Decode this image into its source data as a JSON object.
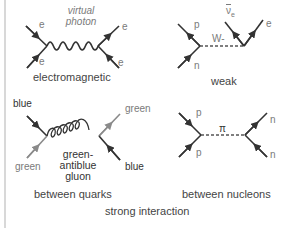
{
  "colors": {
    "line_dark": "#333333",
    "line_grey": "#8a8a8a",
    "label_grey": "#7a7a7a",
    "caption": "#444444",
    "left_rule": "#d8d8d8"
  },
  "diagrams": {
    "electromagnetic": {
      "caption": "electromagnetic",
      "mediator": "virtual photon",
      "mediator_line1": "virtual",
      "mediator_line2": "photon",
      "particles": {
        "top_left": "e",
        "bottom_left": "e",
        "top_right": "e",
        "bottom_right": "e"
      }
    },
    "weak": {
      "caption": "weak",
      "mediator": "W-",
      "particles": {
        "top_left": "p",
        "bottom_left": "n",
        "top_right_a": "ν̄e",
        "top_right_a_main": "ν",
        "top_right_a_sub": "e",
        "top_right_b": "e"
      }
    },
    "quarks": {
      "caption": "between quarks",
      "mediator_line1": "green-",
      "mediator_line2": "antiblue",
      "mediator_line3": "gluon",
      "particles": {
        "top_left": "blue",
        "bottom_left": "green",
        "top_right": "green",
        "bottom_right": "blue"
      }
    },
    "nucleons": {
      "caption": "between nucleons",
      "mediator": "π",
      "particles": {
        "top_left": "p",
        "bottom_left": "p",
        "top_right": "n",
        "bottom_right": "n"
      }
    }
  },
  "group_caption": "strong interaction"
}
